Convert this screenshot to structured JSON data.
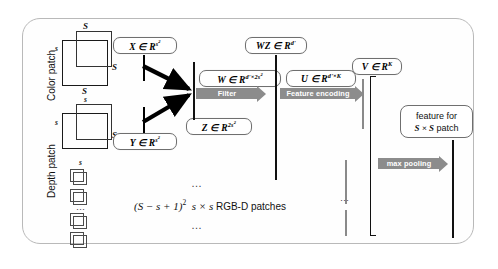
{
  "figure": {
    "side_captions": {
      "color_patch": "Color patch",
      "depth_patch": "Depth patch"
    },
    "patch_dim_labels": {
      "big_top": "S",
      "big_left": "s",
      "big_right": "S",
      "big_bottom": "S",
      "depth_top": "s",
      "depth_left": "s",
      "depth_right": "S",
      "stack_top": "s"
    },
    "boxes": {
      "x": {
        "sym": "X",
        "in": "∈",
        "space": "R",
        "exp": "s2"
      },
      "y": {
        "sym": "Y",
        "in": "∈",
        "space": "R",
        "exp": "s2"
      },
      "z": {
        "sym": "Z",
        "in": "∈",
        "space": "R",
        "exp": "2s2"
      },
      "w": {
        "sym": "W",
        "in": "∈",
        "space": "R",
        "exp": "d'×2s2"
      },
      "wz": {
        "sym": "WZ",
        "in": "∈",
        "space": "R",
        "exp": "d'"
      },
      "u": {
        "sym": "U",
        "in": "∈",
        "space": "R",
        "exp": "d'×K"
      },
      "v": {
        "sym": "V",
        "in": "∈",
        "space": "R",
        "exp": "K"
      }
    },
    "bands": {
      "filter": "Filter",
      "feature_encoding": "Feature encoding",
      "max_pooling": "max pooling"
    },
    "feature_box": {
      "line1": "feature for",
      "line2_sym": "S × S",
      "line2_tail": " patch"
    },
    "center_caption": {
      "formula": "(S − s + 1)",
      "exp": "2",
      "patches": "s × s",
      "tail": "RGB-D patches"
    },
    "ellipsis": "…",
    "colors": {
      "band": "#8c8c8c",
      "frame": "#b9b9b9",
      "stroke": "#1a1a1a",
      "vector_gray": "#8a8a8a",
      "background": "#ffffff"
    }
  }
}
